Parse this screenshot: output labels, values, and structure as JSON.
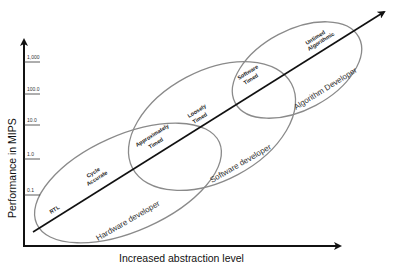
{
  "diagram": {
    "y_axis": {
      "label": "Performance in MIPS",
      "ticks": [
        "1,000",
        "100.0",
        "10.0",
        "1.0",
        "0.1"
      ]
    },
    "x_axis": {
      "label": "Increased abstraction level"
    },
    "stages": [
      {
        "line1": "RTL",
        "line2": ""
      },
      {
        "line1": "Cycle",
        "line2": "Accurate"
      },
      {
        "line1": "Approximately",
        "line2": "Timed"
      },
      {
        "line1": "Loosely",
        "line2": "Timed"
      },
      {
        "line1": "Software",
        "line2": "Timed"
      },
      {
        "line1": "Untimed",
        "line2": "Algorithmic"
      }
    ],
    "roles": {
      "hardware": "Hardware developer",
      "software": "Software developer",
      "algorithm": "Algorithm Developer"
    },
    "colors": {
      "axis": "#111111",
      "ellipse": "#8a8a8a",
      "ellipse_light": "#b5b5b5"
    }
  }
}
